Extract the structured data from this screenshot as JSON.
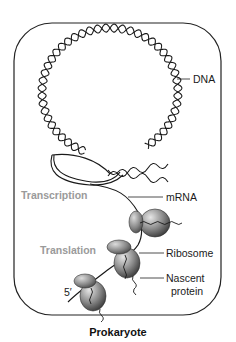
{
  "figure": {
    "caption": "Prokaryote",
    "labels": {
      "dna": "DNA",
      "transcription": "Transcription",
      "mrna": "mRNA",
      "translation": "Translation",
      "ribosome": "Ribosome",
      "nascent_protein_line1": "Nascent",
      "nascent_protein_line2": "protein",
      "five_prime": "5′"
    },
    "colors": {
      "outline": "#222222",
      "process_label": "#9a9a9a",
      "ribosome_fill": "#8a8a8a"
    }
  }
}
